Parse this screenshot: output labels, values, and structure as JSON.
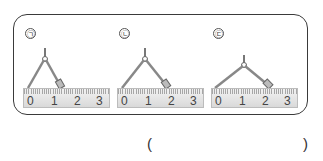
{
  "problem": {
    "panels": [
      {
        "label": "㉠",
        "ruler_numbers": [
          "0",
          "1",
          "2",
          "3"
        ],
        "compass_span_cm": 2
      },
      {
        "label": "㉡",
        "ruler_numbers": [
          "0",
          "1",
          "2",
          "3"
        ],
        "compass_span_cm": 2
      },
      {
        "label": "㉢",
        "ruler_numbers": [
          "0",
          "1",
          "2",
          "3"
        ],
        "compass_span_cm": 2.3
      }
    ],
    "answer": {
      "open_paren": "(",
      "close_paren": ")",
      "value": ""
    }
  }
}
